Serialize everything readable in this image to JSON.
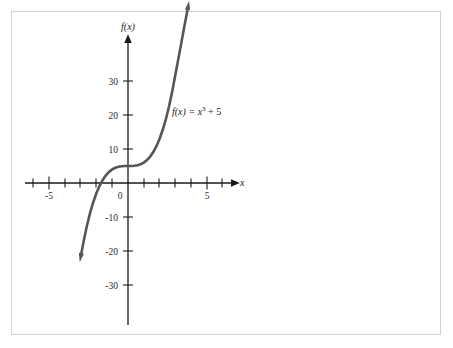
{
  "figure": {
    "background_color": "#ffffff",
    "border_color": "#d2d2d2"
  },
  "chart_data": {
    "type": "line",
    "title": "",
    "subtitle": "",
    "xlabel": "x",
    "ylabel": "f(x)",
    "equation": "f(x) = x",
    "equation_exponent": "3",
    "equation_tail": " + 5",
    "function": "f(x) = x^3 + 5",
    "curve_color": "#555555",
    "axis_color": "#1a1a1a",
    "grid": false,
    "legend": "none",
    "xlim": [
      -6.5,
      7.0
    ],
    "ylim": [
      -36,
      38
    ],
    "xticks": [
      -6,
      -5,
      -4,
      -3,
      -2,
      -1,
      1,
      2,
      3,
      4,
      5,
      6
    ],
    "yticks": [
      -30,
      -20,
      -10,
      10,
      20,
      30
    ],
    "xtick_labels": [
      "-5",
      "0",
      "5"
    ],
    "xtick_label_values": [
      -5,
      0,
      5
    ],
    "ytick_labels": [
      "30",
      "20",
      "10",
      "-10",
      "-20",
      "-30"
    ],
    "ytick_label_values": [
      30,
      20,
      10,
      -10,
      -20,
      -30
    ],
    "origin_label": "0",
    "x_intercept": -1.71,
    "y_intercept": 5,
    "series": [
      {
        "name": "f(x) = x^3 + 5",
        "x": [
          -2.95,
          -2.8,
          -2.6,
          -2.4,
          -2.2,
          -2.0,
          -1.8,
          -1.6,
          -1.4,
          -1.2,
          -1.0,
          -0.8,
          -0.6,
          -0.4,
          -0.2,
          0.0,
          0.2,
          0.4,
          0.6,
          0.8,
          1.0,
          1.2,
          1.4,
          1.6,
          1.8,
          2.0,
          2.2,
          2.4,
          2.6,
          2.8,
          2.95
        ],
        "y": [
          -20.68,
          -16.95,
          -12.58,
          -8.82,
          -5.65,
          -3.0,
          -0.83,
          0.9,
          2.26,
          3.27,
          4.0,
          4.49,
          4.78,
          4.94,
          4.99,
          5.0,
          5.01,
          5.06,
          5.22,
          5.51,
          6.0,
          6.73,
          7.74,
          9.1,
          10.83,
          13.0,
          15.65,
          18.82,
          22.58,
          26.95,
          30.68
        ]
      }
    ],
    "arrows": {
      "curve_top": true,
      "curve_bottom": true,
      "x_axis": true,
      "y_axis": true
    }
  }
}
